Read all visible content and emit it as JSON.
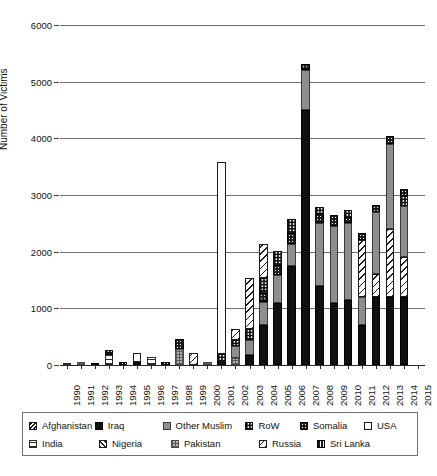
{
  "chart_data": {
    "type": "bar",
    "stacked": true,
    "title": "",
    "xlabel": "",
    "ylabel": "Number of Victims",
    "ylim": [
      0,
      6000
    ],
    "ytick_labels": [
      "0",
      "1000",
      "2000",
      "3000",
      "4000",
      "5000",
      "6000"
    ],
    "ytick_values": [
      0,
      1000,
      2000,
      3000,
      4000,
      5000,
      6000
    ],
    "grid": "horizontal",
    "legend_position": "bottom",
    "categories": [
      "1990",
      "1991",
      "1992",
      "1993",
      "1994",
      "1995",
      "1996",
      "1997",
      "1998",
      "1999",
      "2000",
      "2001",
      "2002",
      "2003",
      "2004",
      "2005",
      "2006",
      "2007",
      "2008",
      "2009",
      "2010",
      "2011",
      "2012",
      "2013",
      "2014",
      "2015"
    ],
    "series": [
      {
        "name": "Afghanistan",
        "pattern": "diagonal-crosshatch",
        "values": [
          0,
          0,
          0,
          0,
          0,
          0,
          0,
          0,
          0,
          0,
          0,
          0,
          0,
          0,
          0,
          0,
          0,
          0,
          0,
          0,
          0,
          0,
          0,
          0,
          0,
          0
        ]
      },
      {
        "name": "Iraq",
        "pattern": "solid-black",
        "values": [
          0,
          0,
          0,
          0,
          0,
          60,
          0,
          0,
          0,
          0,
          0,
          0,
          0,
          170,
          700,
          1100,
          1750,
          4500,
          1400,
          1100,
          1150,
          700,
          1200,
          1200,
          1200,
          0
        ]
      },
      {
        "name": "Other Muslim",
        "pattern": "solid-gray",
        "values": [
          0,
          0,
          0,
          0,
          0,
          0,
          0,
          0,
          0,
          0,
          0,
          0,
          200,
          280,
          420,
          480,
          380,
          700,
          1100,
          1350,
          1350,
          500,
          1100,
          1500,
          900,
          0
        ]
      },
      {
        "name": "RoW",
        "pattern": "fine-grid",
        "values": [
          0,
          0,
          0,
          80,
          0,
          0,
          0,
          0,
          0,
          0,
          0,
          130,
          120,
          180,
          260,
          250,
          250,
          0,
          120,
          0,
          110,
          0,
          0,
          0,
          180,
          0
        ]
      },
      {
        "name": "Somalia",
        "pattern": "black-dotted",
        "values": [
          0,
          0,
          0,
          0,
          0,
          0,
          0,
          0,
          180,
          0,
          0,
          60,
          0,
          0,
          150,
          180,
          200,
          120,
          160,
          200,
          120,
          130,
          130,
          150,
          130,
          0
        ]
      },
      {
        "name": "USA",
        "pattern": "white-outline",
        "values": [
          0,
          0,
          0,
          0,
          0,
          160,
          0,
          0,
          0,
          0,
          0,
          3400,
          0,
          0,
          0,
          0,
          0,
          0,
          0,
          0,
          0,
          0,
          0,
          0,
          0,
          0
        ]
      },
      {
        "name": "India",
        "pattern": "horizontal-dashes",
        "values": [
          40,
          0,
          0,
          180,
          0,
          0,
          150,
          0,
          0,
          0,
          0,
          0,
          0,
          0,
          0,
          0,
          0,
          0,
          0,
          0,
          0,
          0,
          0,
          0,
          0,
          0
        ]
      },
      {
        "name": "Nigeria",
        "pattern": "fine-diagonal",
        "values": [
          0,
          0,
          0,
          0,
          0,
          0,
          0,
          0,
          0,
          0,
          0,
          0,
          0,
          0,
          0,
          0,
          0,
          0,
          0,
          0,
          0,
          0,
          0,
          0,
          0,
          0
        ]
      },
      {
        "name": "Pakistan",
        "pattern": "gray-grid",
        "values": [
          0,
          50,
          0,
          0,
          0,
          0,
          0,
          0,
          280,
          0,
          60,
          0,
          130,
          0,
          0,
          0,
          0,
          0,
          0,
          0,
          0,
          0,
          0,
          0,
          0,
          0
        ]
      },
      {
        "name": "Russia",
        "pattern": "coarse-diagonal",
        "values": [
          0,
          0,
          0,
          0,
          0,
          0,
          0,
          0,
          0,
          220,
          0,
          0,
          180,
          900,
          600,
          0,
          0,
          0,
          0,
          0,
          0,
          1000,
          400,
          1200,
          700,
          0
        ]
      },
      {
        "name": "Sri Lanka",
        "pattern": "black-striped",
        "values": [
          0,
          0,
          20,
          0,
          60,
          0,
          0,
          50,
          0,
          0,
          0,
          0,
          0,
          0,
          0,
          0,
          0,
          0,
          0,
          0,
          0,
          0,
          0,
          0,
          0,
          0
        ]
      }
    ],
    "bars": [
      {
        "year": "1990",
        "total": 40,
        "segments": [
          {
            "series": "India",
            "value": 40
          }
        ]
      },
      {
        "year": "1991",
        "total": 50,
        "segments": [
          {
            "series": "Pakistan",
            "value": 50
          }
        ]
      },
      {
        "year": "1992",
        "total": 20,
        "segments": [
          {
            "series": "Sri Lanka",
            "value": 20
          }
        ]
      },
      {
        "year": "1993",
        "total": 260,
        "segments": [
          {
            "series": "India",
            "value": 180
          },
          {
            "series": "RoW",
            "value": 80
          }
        ]
      },
      {
        "year": "1994",
        "total": 60,
        "segments": [
          {
            "series": "Sri Lanka",
            "value": 60
          }
        ]
      },
      {
        "year": "1995",
        "total": 220,
        "segments": [
          {
            "series": "Iraq",
            "value": 60
          },
          {
            "series": "USA",
            "value": 160
          }
        ]
      },
      {
        "year": "1996",
        "total": 150,
        "segments": [
          {
            "series": "India",
            "value": 150
          }
        ]
      },
      {
        "year": "1997",
        "total": 50,
        "segments": [
          {
            "series": "Sri Lanka",
            "value": 50
          }
        ]
      },
      {
        "year": "1998",
        "total": 460,
        "segments": [
          {
            "series": "Pakistan",
            "value": 280
          },
          {
            "series": "Somalia",
            "value": 180
          }
        ]
      },
      {
        "year": "1999",
        "total": 220,
        "segments": [
          {
            "series": "Russia",
            "value": 220
          }
        ]
      },
      {
        "year": "2000",
        "total": 60,
        "segments": [
          {
            "series": "Pakistan",
            "value": 60
          }
        ]
      },
      {
        "year": "2001",
        "total": 3590,
        "segments": [
          {
            "series": "Somalia",
            "value": 60
          },
          {
            "series": "RoW",
            "value": 130
          },
          {
            "series": "USA",
            "value": 3400
          }
        ]
      },
      {
        "year": "2002",
        "total": 630,
        "segments": [
          {
            "series": "Pakistan",
            "value": 130
          },
          {
            "series": "Other Muslim",
            "value": 200
          },
          {
            "series": "RoW",
            "value": 120
          },
          {
            "series": "Russia",
            "value": 180
          }
        ]
      },
      {
        "year": "2003",
        "total": 1530,
        "segments": [
          {
            "series": "Iraq",
            "value": 170
          },
          {
            "series": "Other Muslim",
            "value": 280
          },
          {
            "series": "RoW",
            "value": 180
          },
          {
            "series": "Russia",
            "value": 900
          }
        ]
      },
      {
        "year": "2004",
        "total": 2130,
        "segments": [
          {
            "series": "Iraq",
            "value": 700
          },
          {
            "series": "Other Muslim",
            "value": 420
          },
          {
            "series": "Somalia",
            "value": 150
          },
          {
            "series": "RoW",
            "value": 260
          },
          {
            "series": "Russia",
            "value": 600
          }
        ]
      },
      {
        "year": "2005",
        "total": 2010,
        "segments": [
          {
            "series": "Iraq",
            "value": 1100
          },
          {
            "series": "Other Muslim",
            "value": 480
          },
          {
            "series": "Somalia",
            "value": 180
          },
          {
            "series": "RoW",
            "value": 250
          }
        ]
      },
      {
        "year": "2006",
        "total": 2580,
        "segments": [
          {
            "series": "Iraq",
            "value": 1750
          },
          {
            "series": "Other Muslim",
            "value": 380
          },
          {
            "series": "Somalia",
            "value": 200
          },
          {
            "series": "RoW",
            "value": 250
          }
        ]
      },
      {
        "year": "2007",
        "total": 5320,
        "segments": [
          {
            "series": "Iraq",
            "value": 4500
          },
          {
            "series": "Other Muslim",
            "value": 700
          },
          {
            "series": "Somalia",
            "value": 120
          }
        ]
      },
      {
        "year": "2008",
        "total": 2780,
        "segments": [
          {
            "series": "Iraq",
            "value": 1400
          },
          {
            "series": "Other Muslim",
            "value": 1100
          },
          {
            "series": "Somalia",
            "value": 160
          },
          {
            "series": "RoW",
            "value": 120
          }
        ]
      },
      {
        "year": "2009",
        "total": 2650,
        "segments": [
          {
            "series": "Iraq",
            "value": 1100
          },
          {
            "series": "Other Muslim",
            "value": 1350
          },
          {
            "series": "Somalia",
            "value": 200
          }
        ]
      },
      {
        "year": "2010",
        "total": 2730,
        "segments": [
          {
            "series": "Iraq",
            "value": 1150
          },
          {
            "series": "Other Muslim",
            "value": 1350
          },
          {
            "series": "Somalia",
            "value": 120
          },
          {
            "series": "RoW",
            "value": 110
          }
        ]
      },
      {
        "year": "2011",
        "total": 2330,
        "segments": [
          {
            "series": "Iraq",
            "value": 700
          },
          {
            "series": "Other Muslim",
            "value": 500
          },
          {
            "series": "Russia",
            "value": 1000
          },
          {
            "series": "Somalia",
            "value": 130
          }
        ]
      },
      {
        "year": "2012",
        "total": 2830,
        "segments": [
          {
            "series": "Iraq",
            "value": 1200
          },
          {
            "series": "Russia",
            "value": 400
          },
          {
            "series": "Other Muslim",
            "value": 1100
          },
          {
            "series": "Somalia",
            "value": 130
          }
        ]
      },
      {
        "year": "2013",
        "total": 4050,
        "segments": [
          {
            "series": "Iraq",
            "value": 1200
          },
          {
            "series": "Russia",
            "value": 1200
          },
          {
            "series": "Other Muslim",
            "value": 1500
          },
          {
            "series": "Somalia",
            "value": 150
          }
        ]
      },
      {
        "year": "2014",
        "total": 2910,
        "segments": [
          {
            "series": "Iraq",
            "value": 1200
          },
          {
            "series": "Russia",
            "value": 700
          },
          {
            "series": "Other Muslim",
            "value": 900
          },
          {
            "series": "RoW",
            "value": 180
          },
          {
            "series": "Somalia",
            "value": 130
          }
        ]
      },
      {
        "year": "2015",
        "total": 0,
        "segments": []
      }
    ]
  },
  "legend": {
    "rows": [
      [
        {
          "label": "Afghanistan",
          "pattern": "afghanistan"
        },
        {
          "label": "Iraq",
          "pattern": "iraq"
        },
        {
          "label": "Other Muslim",
          "pattern": "other-muslim"
        },
        {
          "label": "RoW",
          "pattern": "row"
        },
        {
          "label": "Somalia",
          "pattern": "somalia"
        },
        {
          "label": "USA",
          "pattern": "usa"
        }
      ],
      [
        {
          "label": "India",
          "pattern": "india"
        },
        {
          "label": "Nigeria",
          "pattern": "nigeria"
        },
        {
          "label": "Pakistan",
          "pattern": "pakistan"
        },
        {
          "label": "Russia",
          "pattern": "russia"
        },
        {
          "label": "Sri Lanka",
          "pattern": "sri-lanka"
        }
      ]
    ]
  },
  "colors": {
    "black": "#101010",
    "gray": "#8e8e8e",
    "light_gray": "#b4b4b4",
    "grid": "#6e6e6e",
    "axis": "#2b2b2b",
    "background": "#ffffff"
  }
}
